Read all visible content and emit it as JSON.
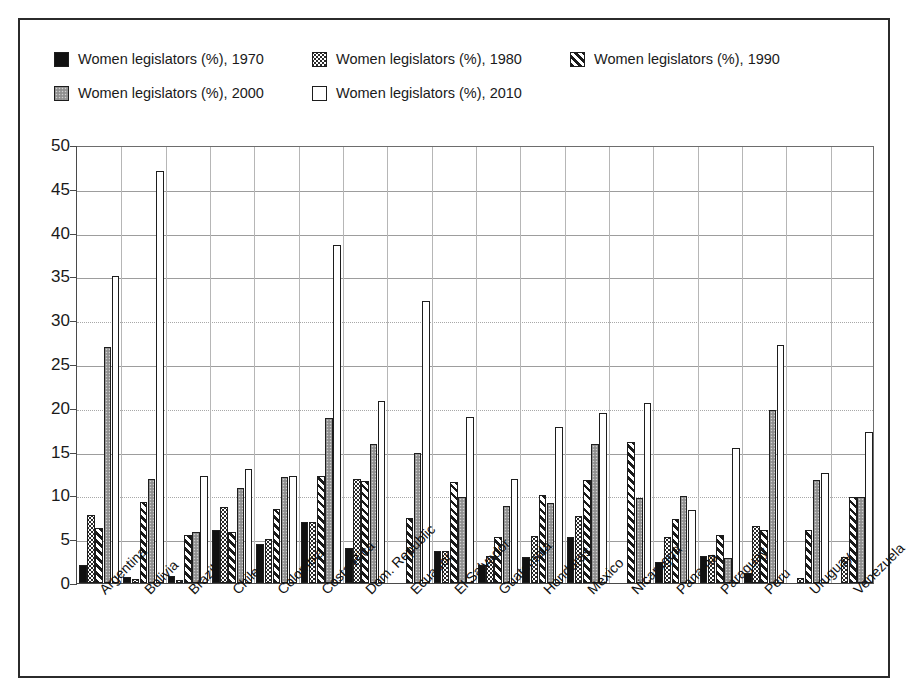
{
  "figure": {
    "border_color": "#2b2b2b",
    "background": "#ffffff"
  },
  "legend": {
    "position": "top-left",
    "items": [
      {
        "label": "Women legislators (%), 1970",
        "swatch": "solid-black-swatch",
        "color": "#111111"
      },
      {
        "label": "Women legislators (%), 1980",
        "swatch": "dotted-light-swatch",
        "color": "#ffffff"
      },
      {
        "label": "Women legislators (%), 1990",
        "swatch": "diagonal-hatch-swatch",
        "color": "#ffffff"
      },
      {
        "label": "Women legislators (%), 2000",
        "swatch": "solid-gray-swatch",
        "color": "#9a9a9a"
      },
      {
        "label": "Women legislators (%), 2010",
        "swatch": "white-outline-swatch",
        "color": "#ffffff"
      }
    ]
  },
  "yaxis": {
    "ticks": [
      "0",
      "5",
      "10",
      "15",
      "20",
      "25",
      "30",
      "35",
      "40",
      "45",
      "50"
    ],
    "min": 0,
    "max": 50,
    "step": 5
  },
  "chart_data": {
    "type": "bar",
    "title": "",
    "subtitle": "",
    "xlabel": "",
    "ylabel": "",
    "ylim": [
      0,
      50
    ],
    "ytick_step": 5,
    "grid": true,
    "legend_position": "top-left",
    "categories": [
      "Argentina",
      "Bolivia",
      "Brazil",
      "Chile",
      "Colombia",
      "Costa Rica",
      "Dom. Republic",
      "Ecuador",
      "El Salvador",
      "Guatemala",
      "Honduras",
      "Mexico",
      "Nicaragua",
      "Panama",
      "Paraguay",
      "Peru",
      "Uruguay",
      "Venezuela"
    ],
    "series": [
      {
        "name": "Women legislators (%), 1970",
        "values": [
          2.1,
          0.7,
          0.8,
          6.0,
          4.4,
          7.0,
          4.0,
          null,
          3.7,
          2.0,
          3.0,
          5.2,
          null,
          2.4,
          3.1,
          1.1,
          null,
          null
        ]
      },
      {
        "name": "Women legislators (%), 1980",
        "values": [
          7.8,
          0.5,
          0.4,
          8.7,
          5.0,
          7.0,
          11.9,
          null,
          3.7,
          3.1,
          5.4,
          7.6,
          null,
          5.3,
          3.2,
          6.5,
          0.6,
          3.0
        ]
      },
      {
        "name": "Women legislators (%), 1990",
        "values": [
          6.3,
          9.2,
          5.5,
          5.8,
          8.4,
          12.2,
          11.7,
          7.4,
          11.5,
          5.2,
          10.1,
          11.8,
          16.1,
          7.3,
          5.5,
          6.0,
          6.0,
          9.8
        ]
      },
      {
        "name": "Women legislators (%), 2000",
        "values": [
          26.9,
          11.9,
          5.8,
          10.9,
          12.1,
          18.8,
          15.9,
          14.8,
          9.8,
          8.8,
          9.1,
          15.9,
          9.7,
          9.9,
          2.8,
          19.7,
          11.8,
          9.8
        ]
      },
      {
        "name": "Women legislators (%), 2010",
        "values": [
          35.0,
          47.0,
          12.2,
          13.0,
          12.2,
          38.6,
          20.8,
          32.2,
          18.9,
          11.9,
          17.8,
          19.4,
          20.5,
          8.3,
          15.4,
          27.2,
          12.6,
          17.2
        ]
      }
    ]
  }
}
